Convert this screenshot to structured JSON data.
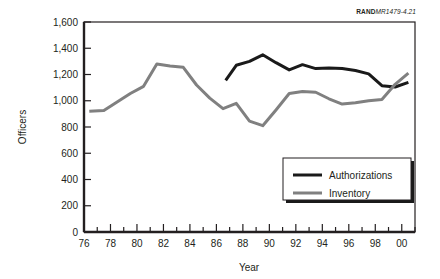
{
  "source_note": {
    "brand": "RAND",
    "code": "MR1479-4.21"
  },
  "chart_data": {
    "type": "line",
    "title": "",
    "xlabel": "Year",
    "ylabel": "Officers",
    "xlim": [
      1976,
      2001
    ],
    "ylim": [
      0,
      1600
    ],
    "ytick_step": 200,
    "xtick_step": 2,
    "minor_xticks": true,
    "grid": false,
    "legend_position": "bottom-right",
    "x_tick_labels": [
      "76",
      "78",
      "80",
      "82",
      "84",
      "86",
      "88",
      "90",
      "92",
      "94",
      "96",
      "98",
      "00"
    ],
    "x_tick_values": [
      1976,
      1978,
      1980,
      1982,
      1984,
      1986,
      1988,
      1990,
      1992,
      1994,
      1996,
      1998,
      2000
    ],
    "y_tick_labels": [
      "0",
      "200",
      "400",
      "600",
      "800",
      "1,000",
      "1,200",
      "1,400",
      "1,600"
    ],
    "y_tick_values": [
      0,
      200,
      400,
      600,
      800,
      1000,
      1200,
      1400,
      1600
    ],
    "colors": {
      "authorizations": "#1a1a1a",
      "inventory": "#808080",
      "axis": "#231f20"
    },
    "series": [
      {
        "name": "Authorizations",
        "color": "#1a1a1a",
        "width": 3,
        "x": [
          1986.7,
          1987.5,
          1988.5,
          1989.5,
          1990.5,
          1991.5,
          1992.5,
          1993.5,
          1994.5,
          1995.5,
          1996.5,
          1997.5,
          1998.5,
          1999.5,
          2000.5
        ],
        "values": [
          1155,
          1270,
          1300,
          1350,
          1290,
          1235,
          1275,
          1245,
          1250,
          1245,
          1230,
          1205,
          1115,
          1105,
          1140
        ]
      },
      {
        "name": "Inventory",
        "color": "#808080",
        "width": 3,
        "x": [
          1976.4,
          1977.5,
          1978.5,
          1979.5,
          1980.5,
          1981.5,
          1982.5,
          1983.5,
          1984.5,
          1985.5,
          1986.5,
          1987.5,
          1988.5,
          1989.5,
          1990.5,
          1991.5,
          1992.5,
          1993.5,
          1994.5,
          1995.5,
          1996.5,
          1997.5,
          1998.5,
          1999.5,
          2000.5
        ],
        "values": [
          920,
          925,
          990,
          1055,
          1110,
          1280,
          1265,
          1255,
          1120,
          1020,
          940,
          980,
          845,
          810,
          930,
          1055,
          1070,
          1065,
          1015,
          975,
          985,
          1000,
          1010,
          1125,
          1210
        ]
      }
    ],
    "legend": [
      {
        "label": "Authorizations",
        "color": "#1a1a1a"
      },
      {
        "label": "Inventory",
        "color": "#808080"
      }
    ]
  }
}
